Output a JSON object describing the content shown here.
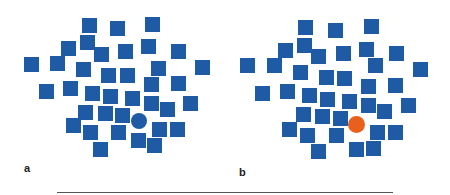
{
  "colors": {
    "square": "#1f5ba4",
    "target_a": "#1f5ba4",
    "target_b": "#e8601c",
    "rule": "#555555"
  },
  "square_size": 15,
  "panels": [
    {
      "label": "a",
      "label_pos": [
        24,
        162
      ],
      "target": {
        "shape": "circle",
        "color": "#1f5ba4",
        "cx": 139,
        "cy": 121,
        "r": 8
      },
      "squares": [
        [
          82,
          18
        ],
        [
          110,
          21
        ],
        [
          145,
          17
        ],
        [
          61,
          41
        ],
        [
          80,
          35
        ],
        [
          94,
          47
        ],
        [
          118,
          44
        ],
        [
          141,
          39
        ],
        [
          171,
          44
        ],
        [
          24,
          57
        ],
        [
          50,
          56
        ],
        [
          76,
          62
        ],
        [
          101,
          68
        ],
        [
          120,
          68
        ],
        [
          151,
          61
        ],
        [
          195,
          60
        ],
        [
          39,
          84
        ],
        [
          63,
          81
        ],
        [
          85,
          86
        ],
        [
          103,
          89
        ],
        [
          125,
          91
        ],
        [
          144,
          77
        ],
        [
          171,
          76
        ],
        [
          78,
          105
        ],
        [
          98,
          106
        ],
        [
          115,
          108
        ],
        [
          144,
          96
        ],
        [
          160,
          102
        ],
        [
          183,
          96
        ],
        [
          66,
          118
        ],
        [
          83,
          125
        ],
        [
          111,
          125
        ],
        [
          131,
          133
        ],
        [
          152,
          122
        ],
        [
          170,
          122
        ],
        [
          93,
          142
        ],
        [
          147,
          138
        ]
      ]
    },
    {
      "label": "b",
      "label_pos": [
        239,
        166
      ],
      "target": {
        "shape": "circle",
        "color": "#e8601c",
        "cx": 356,
        "cy": 124,
        "r": 8.5
      },
      "squares": [
        [
          298,
          20
        ],
        [
          328,
          23
        ],
        [
          364,
          19
        ],
        [
          278,
          43
        ],
        [
          297,
          38
        ],
        [
          311,
          49
        ],
        [
          336,
          46
        ],
        [
          359,
          42
        ],
        [
          389,
          46
        ],
        [
          240,
          58
        ],
        [
          267,
          58
        ],
        [
          293,
          65
        ],
        [
          319,
          70
        ],
        [
          337,
          71
        ],
        [
          368,
          58
        ],
        [
          413,
          62
        ],
        [
          255,
          86
        ],
        [
          280,
          84
        ],
        [
          302,
          88
        ],
        [
          320,
          92
        ],
        [
          342,
          94
        ],
        [
          361,
          79
        ],
        [
          388,
          78
        ],
        [
          296,
          107
        ],
        [
          315,
          109
        ],
        [
          333,
          111
        ],
        [
          361,
          98
        ],
        [
          377,
          104
        ],
        [
          401,
          98
        ],
        [
          282,
          122
        ],
        [
          300,
          128
        ],
        [
          329,
          128
        ],
        [
          349,
          142
        ],
        [
          370,
          125
        ],
        [
          388,
          125
        ],
        [
          311,
          144
        ],
        [
          366,
          141
        ]
      ]
    }
  ],
  "rule": {
    "x1": 57,
    "x2": 393,
    "y": 192
  }
}
